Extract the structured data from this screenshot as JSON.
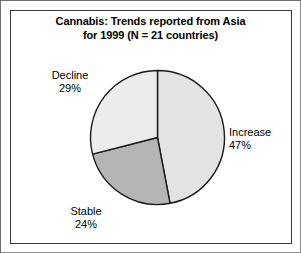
{
  "figure": {
    "title_line1": "Cannabis: Trends reported from Asia",
    "title_line2": "for 1999 (N = 21 countries)",
    "frame_color": "#3a3a3a",
    "background": "#ffffff"
  },
  "labels": {
    "decline": {
      "name": "Decline",
      "pct": "29%"
    },
    "increase": {
      "name": "Increase",
      "pct": "47%"
    },
    "stable": {
      "name": "Stable",
      "pct": "24%"
    }
  },
  "chart_data": {
    "type": "pie",
    "title": "Cannabis: Trends reported from Asia for 1999 (N = 21 countries)",
    "categories": [
      "Increase",
      "Stable",
      "Decline"
    ],
    "values": [
      47,
      24,
      29
    ],
    "value_labels": [
      "47%",
      "24%",
      "29%"
    ],
    "unit": "percent",
    "total": 100,
    "n_countries": 21,
    "year": 1999,
    "region": "Asia",
    "substance": "Cannabis",
    "start_angle_deg": 0,
    "direction": "clockwise",
    "colors": [
      "#e3e3e3",
      "#b5b5b5",
      "#ececec"
    ],
    "edge_color": "#1a1a1a",
    "legend": "none",
    "labels_position": "outside",
    "grid": false
  }
}
